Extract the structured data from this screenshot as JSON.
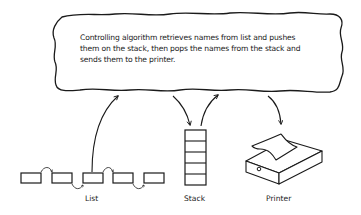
{
  "diagram": {
    "description_lines": [
      "Controlling algorithm retrieves names from list and pushes",
      "them on the stack, then pops the names from the stack and",
      "sends them to the printer."
    ],
    "components": {
      "list": {
        "label": "List",
        "node_count": 5
      },
      "stack": {
        "label": "Stack",
        "cell_count": 5
      },
      "printer": {
        "label": "Printer"
      }
    },
    "flows": [
      {
        "from": "list",
        "to": "controller"
      },
      {
        "from": "controller",
        "to": "stack"
      },
      {
        "from": "stack",
        "to": "controller"
      },
      {
        "from": "controller",
        "to": "printer"
      }
    ],
    "stroke_color": "#1a1a1a",
    "background_color": "#ffffff"
  }
}
